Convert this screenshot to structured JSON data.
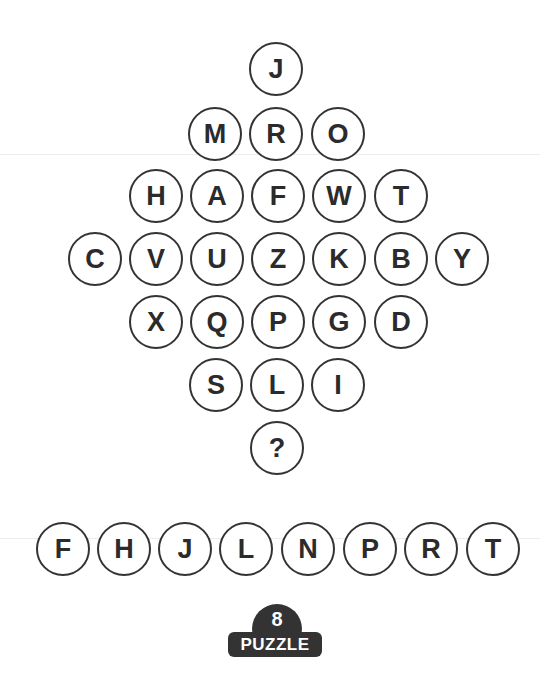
{
  "puzzle": {
    "diamond_rows": [
      [
        "J"
      ],
      [
        "M",
        "R",
        "O"
      ],
      [
        "H",
        "A",
        "F",
        "W",
        "T"
      ],
      [
        "C",
        "V",
        "U",
        "Z",
        "K",
        "B",
        "Y"
      ],
      [
        "X",
        "Q",
        "P",
        "G",
        "D"
      ],
      [
        "S",
        "L",
        "I"
      ],
      [
        "?"
      ]
    ],
    "answer_options": [
      "F",
      "H",
      "J",
      "L",
      "N",
      "P",
      "R",
      "T"
    ],
    "badge": {
      "number": "8",
      "label": "PUZZLE"
    }
  }
}
